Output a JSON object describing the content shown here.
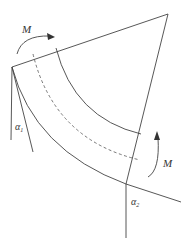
{
  "diagram": {
    "labels": {
      "moment_top": "M",
      "moment_right": "M",
      "angle_left": "α",
      "angle_left_sub": "1",
      "angle_right": "α",
      "angle_right_sub": "2"
    },
    "colors": {
      "line": "#444444",
      "background": "#ffffff"
    }
  }
}
